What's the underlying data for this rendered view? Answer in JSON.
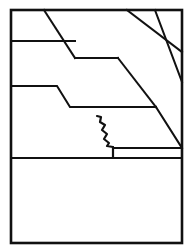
{
  "figure": {
    "caption": "",
    "width": 193,
    "height": 251,
    "background_color": "#ffffff",
    "line_color": "#111111"
  },
  "frame": {
    "name": "outer-rectangle-border",
    "x": 11,
    "y": 10,
    "width": 171,
    "height": 233,
    "stroke_width": 2.6
  },
  "strata": {
    "description": "Stacked sedimentary layers separated by stepped contact lines and truncated by inclined bedding planes",
    "layer_count": 6
  },
  "lines": {
    "diagonal_beds": [
      {
        "name": "inclined-bed-plane-1",
        "points": "44,10 75,58"
      },
      {
        "name": "inclined-bed-plane-2",
        "points": "127,10 182,52"
      },
      {
        "name": "inclined-bed-plane-3",
        "points": "155,10 182,82"
      }
    ],
    "contacts": [
      {
        "name": "upper-contact-stepped",
        "points": "11,41 75,41"
      },
      {
        "name": "upper-contact-step-run",
        "points": "75,58 118,58"
      },
      {
        "name": "upper-contact-descending-limb",
        "points": "118,58 156,107"
      },
      {
        "name": "mid-contact-horizontal-left",
        "points": "11,86 57,86"
      },
      {
        "name": "mid-contact-ramp",
        "points": "57,86 70,107"
      },
      {
        "name": "mid-contact-horizontal-right",
        "points": "70,107 156,107"
      },
      {
        "name": "lower-inclined-bed-plane",
        "points": "156,107 182,148"
      },
      {
        "name": "thin-bed-top",
        "points": "113,148 182,148"
      },
      {
        "name": "basal-contact-horizontal",
        "points": "11,158 182,158"
      }
    ],
    "fracture": {
      "name": "jagged-fracture-trace",
      "points": "97,116 101,117 100,122 105,125 102,130 107,134 104,139 109,143 107,146 113,147",
      "terminal_stub": "113,147 113,158"
    }
  },
  "legend": {
    "visible": false,
    "items": []
  },
  "labels": {
    "visible": false,
    "items": []
  }
}
